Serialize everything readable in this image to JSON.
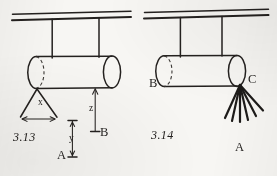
{
  "page": {
    "width": 277,
    "height": 176,
    "background_color": "#f7f6f3",
    "ink_color": "#24211f",
    "type": "scanned-textbook-figure-pair"
  },
  "figures": [
    {
      "id": "fig-3-13",
      "number": "3.13",
      "description": "Cylinder suspended from ceiling by two vertical hangers; V-shaped sling at left end; vertical dimension z up to cylinder underside; separate dimension y",
      "labels": [
        {
          "name": "dimension-x",
          "text": "x",
          "x": 41,
          "y": 103,
          "kind": "dimension"
        },
        {
          "name": "dimension-y",
          "text": "y",
          "x": 72,
          "y": 139,
          "kind": "dimension"
        },
        {
          "name": "dimension-z",
          "text": "z",
          "x": 91,
          "y": 109,
          "kind": "dimension"
        },
        {
          "name": "point-a",
          "text": "A",
          "x": 61,
          "y": 155,
          "kind": "point"
        },
        {
          "name": "point-b",
          "text": "B",
          "x": 101,
          "y": 134,
          "kind": "point"
        },
        {
          "name": "figure-number",
          "text": "3.13",
          "x": 14,
          "y": 137,
          "kind": "figure-number"
        }
      ]
    },
    {
      "id": "fig-3-14",
      "number": "3.14",
      "description": "Cylinder suspended from ceiling by two vertical hangers; point B at left underside, point C at right end with a fan of six radiating lines",
      "labels": [
        {
          "name": "point-b",
          "text": "B",
          "x": 152,
          "y": 83,
          "kind": "point"
        },
        {
          "name": "point-c",
          "text": "C",
          "x": 247,
          "y": 80,
          "kind": "point"
        },
        {
          "name": "point-a",
          "text": "A",
          "x": 238,
          "y": 146,
          "kind": "point"
        },
        {
          "name": "figure-number",
          "text": "3.14",
          "x": 152,
          "y": 134,
          "kind": "figure-number"
        }
      ]
    }
  ],
  "geometry": {
    "fig_3_13": {
      "ceiling_lines": [
        {
          "x1": 12,
          "y1": 14,
          "x2": 131,
          "y2": 11
        },
        {
          "x1": 12,
          "y1": 20,
          "x2": 131,
          "y2": 17
        }
      ],
      "hangers": [
        {
          "x1": 52,
          "y1": 19,
          "x2": 52,
          "y2": 58
        },
        {
          "x1": 99,
          "y1": 18,
          "x2": 99,
          "y2": 57
        }
      ],
      "cylinder": {
        "left_cx": 36,
        "right_cx": 112,
        "cy": 72,
        "rx": 8.5,
        "ry": 16,
        "top_y": 57,
        "bottom_y": 88
      },
      "sling_triangle": {
        "apex_x": 37,
        "apex_y": 89,
        "left_x": 20,
        "right_x": 57,
        "base_y": 119
      },
      "x_dimension": {
        "y": 119,
        "x_left": 20,
        "x_right": 57
      },
      "z_dimension": {
        "x": 95,
        "y_top": 89,
        "y_bottom": 133
      },
      "y_dimension": {
        "x": 72,
        "y_top": 120,
        "y_bottom": 158
      }
    },
    "fig_3_14": {
      "ceiling_lines": [
        {
          "x1": 144,
          "y1": 12,
          "x2": 268,
          "y2": 9
        },
        {
          "x1": 144,
          "y1": 18,
          "x2": 268,
          "y2": 15
        },
        {
          "x1": 255,
          "y1": 10,
          "x2": 268,
          "y2": 9
        }
      ],
      "hangers": [
        {
          "x1": 180,
          "y1": 17,
          "x2": 180,
          "y2": 57
        },
        {
          "x1": 222,
          "y1": 16,
          "x2": 222,
          "y2": 56
        }
      ],
      "cylinder": {
        "left_cx": 164,
        "right_cx": 237,
        "cy": 71,
        "rx": 8.5,
        "ry": 15.5,
        "top_y": 56,
        "bottom_y": 86
      },
      "fan_origin": {
        "x": 240,
        "y": 85
      },
      "fan_line_count": 6,
      "fan_endpoints": [
        {
          "x": 225,
          "y": 118
        },
        {
          "x": 232,
          "y": 121
        },
        {
          "x": 240,
          "y": 122
        },
        {
          "x": 248,
          "y": 120
        },
        {
          "x": 256,
          "y": 116
        },
        {
          "x": 263,
          "y": 111
        }
      ]
    }
  }
}
